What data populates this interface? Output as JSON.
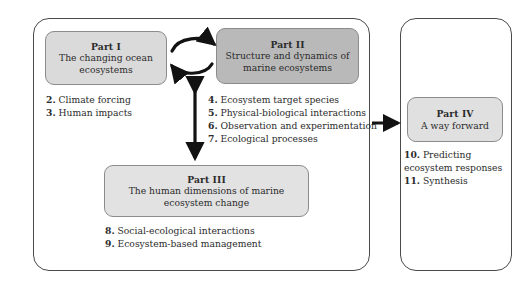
{
  "figure": {
    "panels": {
      "left": {
        "name": "main-framework-panel"
      },
      "right": {
        "name": "way-forward-panel"
      }
    },
    "parts": {
      "part1": {
        "title": "Part I",
        "subtitle": "The changing ocean ecosystems",
        "fill": "#dadada"
      },
      "part2": {
        "title": "Part II",
        "subtitle": "Structure and dynamics of marine ecosystems",
        "fill": "#b9b9b9"
      },
      "part3": {
        "title": "Part III",
        "subtitle": "The human dimensions of marine ecosystem change",
        "fill": "#e2e2e2"
      },
      "part4": {
        "title": "Part IV",
        "subtitle": "A way forward",
        "fill": "#e0e0e0"
      }
    },
    "chapters": {
      "part1": [
        {
          "num": "2.",
          "text": "Climate forcing"
        },
        {
          "num": "3.",
          "text": "Human impacts"
        }
      ],
      "part2": [
        {
          "num": "4.",
          "text": "Ecosystem target species"
        },
        {
          "num": "5.",
          "text": "Physical-biological interactions"
        },
        {
          "num": "6.",
          "text": "Observation and experimentation"
        },
        {
          "num": "7.",
          "text": "Ecological processes"
        }
      ],
      "part3": [
        {
          "num": "8.",
          "text": "Social-ecological interactions"
        },
        {
          "num": "9.",
          "text": "Ecosystem-based management"
        }
      ],
      "part4": [
        {
          "num": "10.",
          "text": "Predicting ecosystem responses"
        },
        {
          "num": "11.",
          "text": "Synthesis"
        }
      ]
    },
    "connectors": [
      {
        "name": "curved-double-arrow-part1-part2",
        "style": "bidirectional-curved"
      },
      {
        "name": "vertical-double-arrow-to-part3",
        "style": "bidirectional-straight"
      },
      {
        "name": "horizontal-arrow-to-part4",
        "style": "unidirectional-straight"
      }
    ],
    "colors": {
      "outline": "#4a4a4a",
      "box_outline": "#8c8c8c",
      "arrow": "#121212",
      "text": "#2b2b2b",
      "background": "#ffffff"
    }
  }
}
